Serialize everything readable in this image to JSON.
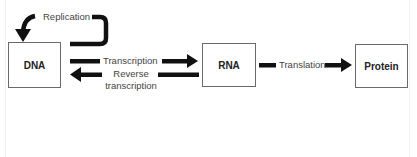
{
  "diagram": {
    "type": "flow",
    "nodes": [
      {
        "id": "dna",
        "label": "DNA"
      },
      {
        "id": "rna",
        "label": "RNA"
      },
      {
        "id": "protein",
        "label": "Protein"
      }
    ],
    "edges": {
      "replication": {
        "from": "dna",
        "to": "dna",
        "label": "Replication"
      },
      "transcription": {
        "from": "dna",
        "to": "rna",
        "label": "Transcription"
      },
      "reverse_transcription": {
        "from": "rna",
        "to": "dna",
        "label_line1": "Reverse",
        "label_line2": "transcription"
      },
      "translation": {
        "from": "rna",
        "to": "protein",
        "label": "Translation"
      }
    },
    "colors": {
      "arrow": "#111111",
      "box_border": "#6a6a6a",
      "text": "#444444"
    }
  }
}
